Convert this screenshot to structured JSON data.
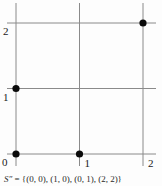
{
  "chart_data": {
    "type": "scatter",
    "title": "",
    "xlabel": "",
    "ylabel": "",
    "points": [
      {
        "x": 0,
        "y": 0
      },
      {
        "x": 1,
        "y": 0
      },
      {
        "x": 0,
        "y": 1
      },
      {
        "x": 2,
        "y": 2
      }
    ],
    "x_ticks": [
      0,
      1,
      2
    ],
    "y_ticks": [
      0,
      1,
      2
    ],
    "x_tick_labels": [
      "0",
      "1",
      "2"
    ],
    "y_tick_labels": [
      "0",
      "1",
      "2"
    ],
    "xlim": [
      0,
      2
    ],
    "ylim": [
      0,
      2
    ],
    "grid": true,
    "legend": false,
    "colors": {
      "grid_line": "#8a8a8a",
      "point": "#0a0a0a",
      "tick_label": "#1a1a1a",
      "background": "#fdfdfd"
    }
  },
  "caption": {
    "set_name": "S″",
    "set_definition": " = {(0, 0), (1, 0), (0, 1), (2, 2)}"
  }
}
